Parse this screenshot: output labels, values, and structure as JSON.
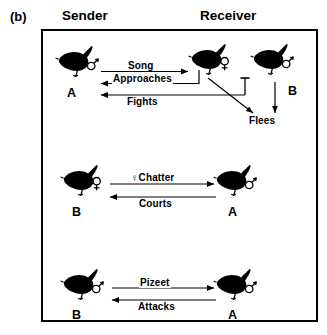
{
  "figure": {
    "panel_label": "(b)",
    "columns": [
      {
        "label": "Sender"
      },
      {
        "label": "Receiver"
      }
    ]
  },
  "rows": [
    {
      "id": "row-aggressive-male",
      "sender": {
        "name": "A",
        "sex": "male",
        "sex_symbol": "♂"
      },
      "receiver_primary": {
        "name": "",
        "sex": "female",
        "sex_symbol": "♀"
      },
      "receiver_secondary": {
        "name": "B",
        "sex": "male",
        "sex_symbol": "♂"
      },
      "signals": [
        {
          "id": "song",
          "label": "Song",
          "direction": "sender-to-receiver"
        },
        {
          "id": "approaches",
          "label": "Approaches",
          "direction": "receiver-to-sender"
        },
        {
          "id": "fights",
          "label": "Fights",
          "direction": "receiver-to-sender"
        }
      ],
      "outcome": {
        "id": "flees",
        "label": "Flees"
      }
    },
    {
      "id": "row-female-chatter",
      "sender": {
        "name": "B",
        "sex": "female",
        "sex_symbol": "♀"
      },
      "receiver_primary": {
        "name": "A",
        "sex": "male",
        "sex_symbol": "♂"
      },
      "signals": [
        {
          "id": "chatter",
          "label": "Chatter",
          "prefix_symbol": "♀",
          "direction": "sender-to-receiver"
        },
        {
          "id": "courts",
          "label": "Courts",
          "direction": "receiver-to-sender"
        }
      ]
    },
    {
      "id": "row-pizeet",
      "sender": {
        "name": "B",
        "sex": "male",
        "sex_symbol": "♂"
      },
      "receiver_primary": {
        "name": "A",
        "sex": "male",
        "sex_symbol": "♂"
      },
      "signals": [
        {
          "id": "pizeet",
          "label": "Pizeet",
          "direction": "sender-to-receiver"
        },
        {
          "id": "attacks",
          "label": "Attacks",
          "direction": "receiver-to-sender"
        }
      ]
    }
  ],
  "colors": {
    "ink": "#000000",
    "background": "#ffffff"
  }
}
